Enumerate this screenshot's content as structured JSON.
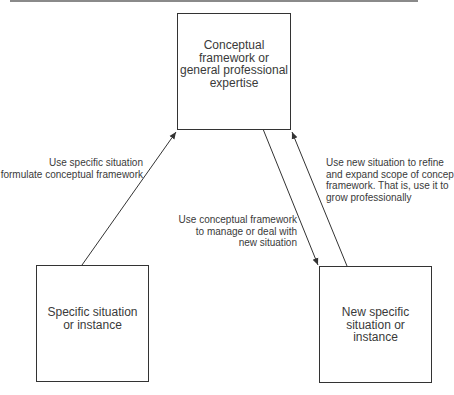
{
  "diagram": {
    "type": "flow-cycle",
    "nodes": [
      {
        "id": "framework",
        "lines": [
          "Conceptual",
          "framework or",
          "general professional",
          "expertise"
        ]
      },
      {
        "id": "specific",
        "lines": [
          "Specific situation",
          "or instance"
        ]
      },
      {
        "id": "new_specific",
        "lines": [
          "New specific",
          "situation or",
          "instance"
        ]
      }
    ],
    "edges": [
      {
        "from": "specific",
        "to": "framework",
        "label_lines": [
          "Use specific situation",
          "formulate conceptual framework"
        ]
      },
      {
        "from": "framework",
        "to": "new_specific",
        "label_lines": [
          "Use conceptual framework",
          "to manage or deal with",
          "new situation"
        ]
      },
      {
        "from": "new_specific",
        "to": "framework",
        "label_lines": [
          "Use new situation to refine",
          "and expand scope of concep",
          "framework. That is, use it to",
          "grow professionally"
        ]
      }
    ]
  },
  "colors": {
    "line": "#333333",
    "text": "#3a3a3a",
    "rule": "#8a8a8a"
  }
}
